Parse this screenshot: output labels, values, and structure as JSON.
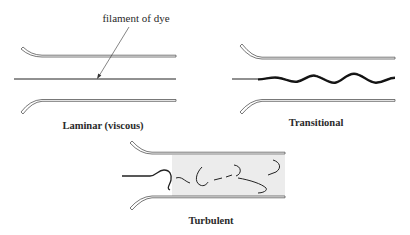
{
  "figure": {
    "annotation": "filament of dye",
    "panels": [
      {
        "id": "laminar",
        "label": "Laminar (viscous)"
      },
      {
        "id": "transitional",
        "label": "Transitional"
      },
      {
        "id": "turbulent",
        "label": "Turbulent"
      }
    ]
  },
  "colors": {
    "stroke": "#555555",
    "dye": "#222222",
    "turbulent_shading": "#ececec"
  }
}
